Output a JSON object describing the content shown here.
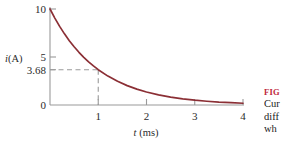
{
  "chart_data": {
    "type": "line",
    "title": "",
    "xlabel": "t (ms)",
    "ylabel": "i(A)",
    "xlim": [
      0,
      4
    ],
    "ylim": [
      0,
      10
    ],
    "grid": false,
    "legend": "none",
    "x_ticks": [
      "1",
      "2",
      "3",
      "4"
    ],
    "x_tick_values": [
      1,
      2,
      3,
      4
    ],
    "y_ticks": [
      "10",
      "5",
      "3.68",
      "0"
    ],
    "y_tick_values": [
      10,
      5,
      3.68,
      0
    ],
    "series": [
      {
        "name": "i(t) = 10e^(-t/1ms)",
        "color": "#8b2f35",
        "x": [
          0,
          0.1,
          0.2,
          0.3,
          0.4,
          0.5,
          0.6,
          0.7,
          0.8,
          0.9,
          1.0,
          1.2,
          1.4,
          1.6,
          1.8,
          2.0,
          2.25,
          2.5,
          2.75,
          3.0,
          3.25,
          3.5,
          3.75,
          4.0
        ],
        "values": [
          10.0,
          9.05,
          8.19,
          7.41,
          6.7,
          6.07,
          5.49,
          4.97,
          4.49,
          4.07,
          3.68,
          3.01,
          2.47,
          2.02,
          1.65,
          1.35,
          1.05,
          0.82,
          0.64,
          0.5,
          0.39,
          0.3,
          0.24,
          0.18
        ]
      }
    ],
    "annotations": [
      {
        "name": "tau-marker",
        "type": "dashed-guide",
        "x": 1,
        "y": 3.68,
        "label": "3.68"
      }
    ]
  },
  "axes": {
    "y_label": "i(A)",
    "y_label_var": "i",
    "y_label_unit": "(A)",
    "x_label": "t (ms)",
    "x_label_var": "t",
    "x_label_unit": "(ms)",
    "tick_10": "10",
    "tick_5": "5",
    "tick_368": "3.68",
    "tick_0": "0",
    "tick_x1": "1",
    "tick_x2": "2",
    "tick_x3": "3",
    "tick_x4": "4"
  },
  "caption": {
    "head": "FIG",
    "line1": "Cur",
    "line2": "diff",
    "line3": "wh"
  },
  "colors": {
    "curve": "#8b2f35",
    "axis": "#9a9a9a",
    "dash": "#9a9a9a",
    "text": "#2b2b2b",
    "caption_accent": "#c0283c",
    "background": "#ffffff"
  }
}
